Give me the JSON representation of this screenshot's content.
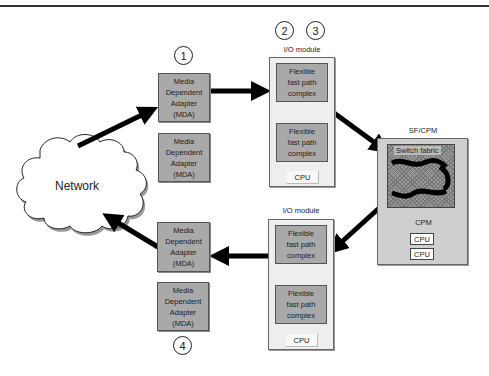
{
  "diagram": {
    "network": {
      "label": "Network"
    },
    "steps": [
      "1",
      "2",
      "3",
      "4"
    ],
    "mda_label": "Media\nDependent\nAdapter\n(MDA)",
    "mdas": [
      {
        "label": "Media\nDependent\nAdapter\n(MDA)"
      },
      {
        "label": "Media\nDependent\nAdapter\n(MDA)"
      },
      {
        "label": "Media\nDependent\nAdapter\n(MDA)"
      },
      {
        "label": "Media\nDependent\nAdapter\n(MDA)"
      }
    ],
    "io_modules": [
      {
        "title": "I/O module",
        "complexes": [
          "Flexible\nfast path\ncomplex",
          "Flexible\nfast path\ncomplex"
        ],
        "cpu": "CPU"
      },
      {
        "title": "I/O module",
        "complexes": [
          "Flexible\nfast path\ncomplex",
          "Flexible\nfast path\ncomplex"
        ],
        "cpu": "CPU"
      }
    ],
    "sfcpm": {
      "title": "SF/CPM",
      "switch_fabric": "Switch fabric",
      "cpm": "CPM",
      "cpus": [
        "CPU",
        "CPU"
      ]
    },
    "colors": {
      "component_fill": "#a9a9a9",
      "module_fill": "#eeeeee",
      "sfcpm_fill": "#cfcfcf",
      "arrow": "#000000"
    }
  }
}
